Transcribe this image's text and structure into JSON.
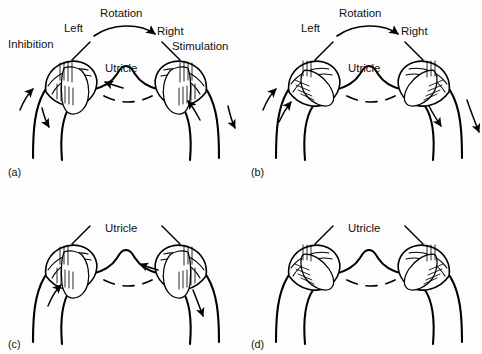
{
  "figure": {
    "background_color": "#fdfdfd",
    "ink_color": "#000000"
  },
  "panels": [
    {
      "id": "a",
      "id_label": "(a)",
      "labels": {
        "rotation": "Rotation",
        "left": "Left",
        "right": "Right",
        "inhibition": "Inhibition",
        "stimulation": "Stimulation",
        "utricle": "Utricle"
      }
    },
    {
      "id": "b",
      "id_label": "(b)",
      "labels": {
        "rotation": "Rotation",
        "left": "Left",
        "right": "Right",
        "utricle": "Utricle"
      }
    },
    {
      "id": "c",
      "id_label": "(c)",
      "labels": {
        "utricle": "Utricle"
      }
    },
    {
      "id": "d",
      "id_label": "(d)",
      "labels": {
        "utricle": "Utricle"
      }
    }
  ],
  "icons": {
    "rotation_arc": "curved-arrow-icon",
    "flow_arrow": "arrow-icon",
    "leader_line": "leader-line-icon",
    "utricle_connector": "dashed-connector-icon"
  }
}
